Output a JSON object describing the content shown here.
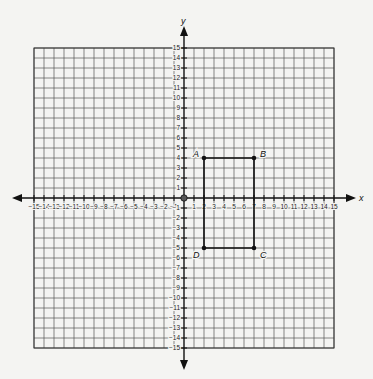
{
  "diagram": {
    "type": "coordinate-plane",
    "x_axis_label": "x",
    "y_axis_label": "y",
    "x_range": [
      -15,
      15
    ],
    "y_range": [
      -15,
      15
    ],
    "origin_label": "0",
    "x_ticks": [
      "-15",
      "-14",
      "-13",
      "-12",
      "-11",
      "-10",
      "-9",
      "-8",
      "-7",
      "-6",
      "-5",
      "-4",
      "-3",
      "-2",
      "-1",
      "1",
      "2",
      "3",
      "4",
      "5",
      "6",
      "7",
      "8",
      "9",
      "10",
      "11",
      "12",
      "13",
      "14",
      "15"
    ],
    "y_ticks": [
      "15",
      "14",
      "13",
      "12",
      "11",
      "10",
      "9",
      "8",
      "7",
      "6",
      "5",
      "4",
      "3",
      "2",
      "1",
      "-1",
      "-2",
      "-3",
      "-4",
      "-5",
      "-6",
      "-7",
      "-8",
      "-9",
      "-10",
      "-11",
      "-12",
      "-13",
      "-14",
      "-15"
    ],
    "points": [
      {
        "label": "A",
        "x": 2,
        "y": 4
      },
      {
        "label": "B",
        "x": 7,
        "y": 4
      },
      {
        "label": "C",
        "x": 7,
        "y": -5
      },
      {
        "label": "D",
        "x": 2,
        "y": -5
      }
    ],
    "polygon": [
      "A",
      "B",
      "C",
      "D"
    ],
    "colors": {
      "grid": "#555555",
      "axis": "#111111",
      "shape": "#111111",
      "background": "#f4f4f2"
    }
  }
}
